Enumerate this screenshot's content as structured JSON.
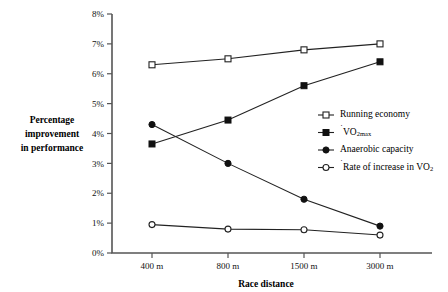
{
  "chart_data": {
    "type": "line",
    "title": "",
    "xlabel": "Race distance",
    "ylabel": "Percentage improvement in performance",
    "categories": [
      "400 m",
      "800 m",
      "1500 m",
      "3000 m"
    ],
    "ytick_labels": [
      "0%",
      "1%",
      "2%",
      "3%",
      "4%",
      "5%",
      "6%",
      "7%",
      "8%"
    ],
    "ytick_values": [
      0,
      1,
      2,
      3,
      4,
      5,
      6,
      7,
      8
    ],
    "ylim": [
      0,
      8
    ],
    "grid": false,
    "legend_position": "center-right",
    "series": [
      {
        "name": "Running economy",
        "marker": "open-square",
        "values": [
          6.3,
          6.5,
          6.8,
          7.0
        ]
      },
      {
        "name": "VO2max",
        "marker": "filled-square",
        "values": [
          3.65,
          4.45,
          5.6,
          6.4
        ]
      },
      {
        "name": "Anaerobic capacity",
        "marker": "filled-circle",
        "values": [
          4.3,
          3.0,
          1.8,
          0.9
        ]
      },
      {
        "name": "Rate of increase in VO2",
        "marker": "open-circle",
        "values": [
          0.95,
          0.8,
          0.78,
          0.6
        ]
      }
    ]
  },
  "ylabel_lines": [
    "Percentage",
    "improvement",
    "in performance"
  ],
  "legend": {
    "items": [
      {
        "label": "Running economy",
        "marker": "open-square"
      },
      {
        "label": "VO",
        "sub": "2max",
        "overdot": true,
        "marker": "filled-square"
      },
      {
        "label": "Anaerobic capacity",
        "marker": "filled-circle"
      },
      {
        "label": "Rate of increase in VO",
        "sub": "2",
        "overdot": true,
        "marker": "open-circle"
      }
    ]
  },
  "colors": {
    "line": "#222222",
    "axis": "#555555",
    "background": "#ffffff"
  }
}
